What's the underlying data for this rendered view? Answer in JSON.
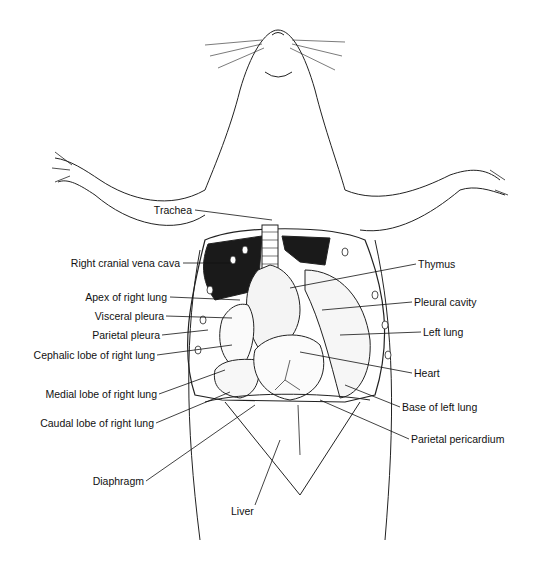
{
  "figure": {
    "labels_left": [
      {
        "text": "Trachea",
        "x": 192,
        "y": 210
      },
      {
        "text": "Right cranial vena cava",
        "x": 180,
        "y": 263
      },
      {
        "text": "Apex of right lung",
        "x": 167,
        "y": 297
      },
      {
        "text": "Visceral pleura",
        "x": 164,
        "y": 316
      },
      {
        "text": "Parietal pleura",
        "x": 160,
        "y": 335
      },
      {
        "text": "Cephalic lobe of right lung",
        "x": 155,
        "y": 355
      },
      {
        "text": "Medial lobe of right lung",
        "x": 157,
        "y": 394
      },
      {
        "text": "Caudal lobe of right lung",
        "x": 154,
        "y": 423
      },
      {
        "text": "Diaphragm",
        "x": 144,
        "y": 481
      }
    ],
    "labels_right": [
      {
        "text": "Thymus",
        "x": 418,
        "y": 264
      },
      {
        "text": "Pleural cavity",
        "x": 414,
        "y": 302
      },
      {
        "text": "Left lung",
        "x": 423,
        "y": 332
      },
      {
        "text": "Heart",
        "x": 414,
        "y": 373
      },
      {
        "text": "Base of left lung",
        "x": 402,
        "y": 407
      },
      {
        "text": "Parietal pericardium",
        "x": 411,
        "y": 439
      }
    ],
    "labels_bottom": [
      {
        "text": "Liver",
        "x": 243,
        "y": 512
      }
    ]
  }
}
